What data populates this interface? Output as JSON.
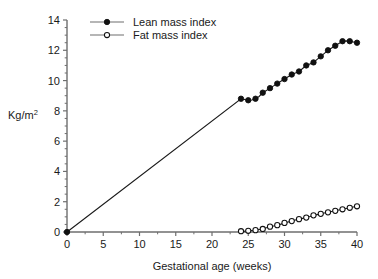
{
  "chart_data": {
    "type": "line",
    "title": "",
    "xlabel": "Gestational age (weeks)",
    "ylabel": "Kg/m2",
    "ylabel_base": "Kg/m",
    "ylabel_sup": "2",
    "xlim": [
      0,
      40
    ],
    "ylim": [
      0,
      14
    ],
    "xticks": [
      0,
      5,
      10,
      15,
      20,
      25,
      30,
      35,
      40
    ],
    "yticks": [
      0,
      2,
      4,
      6,
      8,
      10,
      12,
      14
    ],
    "xtick_labels": [
      "0",
      "5",
      "10",
      "15",
      "20",
      "25",
      "30",
      "35",
      "40"
    ],
    "ytick_labels": [
      "0",
      "2",
      "4",
      "6",
      "8",
      "10",
      "12",
      "14"
    ],
    "minor_ticks": true,
    "grid": false,
    "legend_position": "top-left",
    "line_color": "#1a1a1a",
    "axis_color": "#6e6e6e",
    "series": [
      {
        "name": "Lean mass index",
        "marker": "filled-circle",
        "marker_color": "#111111",
        "x": [
          0,
          24,
          25,
          26,
          27,
          28,
          29,
          30,
          31,
          32,
          33,
          34,
          35,
          36,
          37,
          38,
          39,
          40
        ],
        "y": [
          0,
          8.8,
          8.7,
          8.8,
          9.2,
          9.5,
          9.8,
          10.1,
          10.4,
          10.6,
          11.0,
          11.2,
          11.6,
          12.0,
          12.3,
          12.6,
          12.6,
          12.5
        ],
        "x_dense": [
          0,
          24,
          24.5,
          25,
          25.5,
          26,
          26.5,
          27,
          27.5,
          28,
          28.5,
          29,
          29.5,
          30,
          30.5,
          31,
          31.5,
          32,
          32.5,
          33,
          33.5,
          34,
          34.5,
          35,
          35.5,
          36,
          36.5,
          37,
          37.5,
          38,
          38.5,
          39,
          39.5,
          40
        ],
        "y_dense": [
          0,
          8.8,
          8.75,
          8.7,
          8.72,
          8.8,
          8.95,
          9.2,
          9.35,
          9.5,
          9.65,
          9.8,
          9.95,
          10.1,
          10.25,
          10.4,
          10.5,
          10.6,
          10.8,
          11.0,
          11.1,
          11.2,
          11.4,
          11.6,
          11.8,
          12.0,
          12.15,
          12.3,
          12.45,
          12.6,
          12.62,
          12.6,
          12.55,
          12.5
        ]
      },
      {
        "name": "Fat mass index",
        "marker": "open-circle",
        "marker_color": "#ffffff",
        "x": [
          24,
          25,
          26,
          27,
          28,
          29,
          30,
          31,
          32,
          33,
          34,
          35,
          36,
          37,
          38,
          39,
          40
        ],
        "y": [
          0.05,
          0.08,
          0.12,
          0.2,
          0.35,
          0.45,
          0.6,
          0.72,
          0.85,
          0.95,
          1.1,
          1.2,
          1.3,
          1.4,
          1.5,
          1.6,
          1.7
        ],
        "x_dense": [
          24,
          24.5,
          25,
          25.5,
          26,
          26.5,
          27,
          27.5,
          28,
          28.5,
          29,
          29.5,
          30,
          30.5,
          31,
          31.5,
          32,
          32.5,
          33,
          33.5,
          34,
          34.5,
          35,
          35.5,
          36,
          36.5,
          37,
          37.5,
          38,
          38.5,
          39,
          39.5,
          40
        ],
        "y_dense": [
          0.05,
          0.06,
          0.08,
          0.1,
          0.12,
          0.16,
          0.2,
          0.28,
          0.35,
          0.4,
          0.45,
          0.52,
          0.6,
          0.66,
          0.72,
          0.79,
          0.85,
          0.9,
          0.95,
          1.02,
          1.1,
          1.15,
          1.2,
          1.25,
          1.3,
          1.35,
          1.4,
          1.45,
          1.5,
          1.55,
          1.6,
          1.65,
          1.7
        ]
      }
    ]
  },
  "legend": {
    "items": [
      {
        "label": "Lean mass index",
        "marker": "filled-circle"
      },
      {
        "label": "Fat mass index",
        "marker": "open-circle"
      }
    ]
  }
}
